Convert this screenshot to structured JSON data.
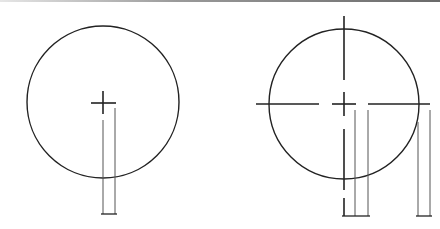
{
  "figure": {
    "stroke_color": "#222222",
    "left": {
      "label": "incorrect-centerline",
      "circle": {
        "cx": 103,
        "cy": 102,
        "r": 76
      },
      "center_mark": {
        "x": 103,
        "y": 102,
        "size": 12
      },
      "extension_lines": [
        {
          "x": 103,
          "y1": 120,
          "y2": 214
        },
        {
          "x": 115,
          "y1": 108,
          "y2": 214
        }
      ],
      "dimension_line": {
        "x1": 103,
        "x2": 115,
        "y": 214
      }
    },
    "right": {
      "label": "correct-centerline",
      "circle": {
        "cx": 344,
        "cy": 104,
        "r": 75
      },
      "extension_lines": [
        {
          "x": 355,
          "y1": 110,
          "y2": 216
        },
        {
          "x": 368,
          "y1": 110,
          "y2": 216
        },
        {
          "x": 418,
          "y1": 122,
          "y2": 216
        },
        {
          "x": 430,
          "y1": 110,
          "y2": 216
        }
      ]
    }
  }
}
